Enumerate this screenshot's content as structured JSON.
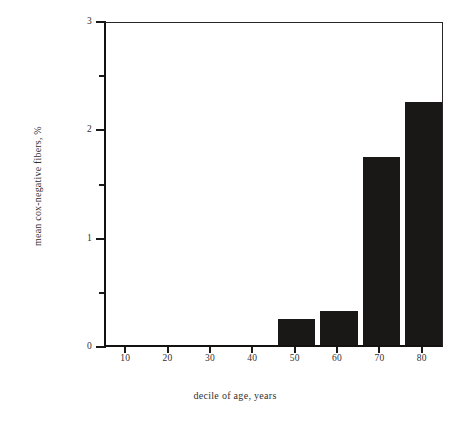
{
  "chart_data": {
    "type": "bar",
    "title": "",
    "subtitle": "",
    "xlabel": "decile of age, years",
    "ylabel": "mean cox-negative fibers, %",
    "categories": [
      "10",
      "20",
      "30",
      "40",
      "50",
      "60",
      "70",
      "80"
    ],
    "values": [
      0,
      0,
      0,
      0,
      0.24,
      0.31,
      1.74,
      2.24
    ],
    "series": [
      {
        "name": "mean cox-negative fibers",
        "values": [
          0,
          0,
          0,
          0,
          0.24,
          0.31,
          1.74,
          2.24
        ]
      }
    ],
    "xlim": [
      5,
      85
    ],
    "ylim": [
      0,
      3
    ],
    "x_tick_labels": [
      "10",
      "20",
      "30",
      "40",
      "50",
      "60",
      "70",
      "80"
    ],
    "x_tick_values": [
      10,
      20,
      30,
      40,
      50,
      60,
      70,
      80
    ],
    "y_tick_labels": [
      "0",
      "1",
      "2",
      "3"
    ],
    "y_tick_values": [
      0,
      1,
      2,
      3
    ],
    "y_minor_tick_values": [
      0.5,
      1.5,
      2.5
    ],
    "grid": false,
    "legend": false,
    "legend_position": "none",
    "bar_color": "#1a1717",
    "axis_color": "#1b1818",
    "background_color": "#ffffff",
    "bar_width_years": 8.8,
    "annotations": []
  },
  "axes": {
    "y_ticks": [
      {
        "label": "3",
        "value": 3,
        "minor": false
      },
      {
        "label": "",
        "value": 2.5,
        "minor": true
      },
      {
        "label": "2",
        "value": 2,
        "minor": false
      },
      {
        "label": "",
        "value": 1.5,
        "minor": true
      },
      {
        "label": "1",
        "value": 1,
        "minor": false
      },
      {
        "label": "",
        "value": 0.5,
        "minor": true
      },
      {
        "label": "0",
        "value": 0,
        "minor": false
      }
    ],
    "x_ticks": [
      {
        "label": "10",
        "value": 10
      },
      {
        "label": "20",
        "value": 20
      },
      {
        "label": "30",
        "value": 30
      },
      {
        "label": "40",
        "value": 40
      },
      {
        "label": "50",
        "value": 50
      },
      {
        "label": "60",
        "value": 60
      },
      {
        "label": "70",
        "value": 70
      },
      {
        "label": "80",
        "value": 80
      }
    ]
  }
}
